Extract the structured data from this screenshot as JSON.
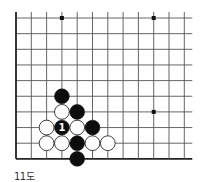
{
  "diagram": {
    "caption": "11도",
    "grid": {
      "cols": 12,
      "rows": 10,
      "origin_x": 16,
      "origin_y": 18,
      "step_x": 15.3,
      "step_y": 15.65,
      "left_edge": true,
      "bottom_edge": true,
      "line_extend_right": 8,
      "line_extend_top": 6,
      "line_color": "#555555",
      "edge_color": "#222222"
    },
    "star_points": [
      {
        "col": 3,
        "row": 0
      },
      {
        "col": 9,
        "row": 0
      },
      {
        "col": 9,
        "row": 6
      }
    ],
    "stones": [
      {
        "color": "black",
        "col": 3,
        "row": 5
      },
      {
        "color": "white",
        "col": 3,
        "row": 6
      },
      {
        "color": "black",
        "col": 4,
        "row": 6
      },
      {
        "color": "white",
        "col": 2,
        "row": 7
      },
      {
        "color": "black",
        "col": 3,
        "row": 7,
        "label": "1"
      },
      {
        "color": "white",
        "col": 4,
        "row": 7
      },
      {
        "color": "black",
        "col": 5,
        "row": 7
      },
      {
        "color": "white",
        "col": 2,
        "row": 8
      },
      {
        "color": "white",
        "col": 3,
        "row": 8
      },
      {
        "color": "black",
        "col": 4,
        "row": 8
      },
      {
        "color": "white",
        "col": 5,
        "row": 8
      },
      {
        "color": "white",
        "col": 6,
        "row": 8
      },
      {
        "color": "black",
        "col": 4,
        "row": 9
      }
    ]
  }
}
